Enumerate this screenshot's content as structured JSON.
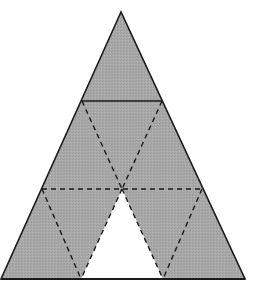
{
  "diagram": {
    "colors": {
      "background": "#ffffff",
      "shaded_fill": "#a8a8a8",
      "unshaded_fill": "#ffffff",
      "stroke": "#1a1a1a"
    },
    "outer_triangle": {
      "apex": [
        121,
        12
      ],
      "base_left": [
        1,
        279
      ],
      "base_right": [
        245,
        279
      ]
    },
    "solid_lines": [
      {
        "from": [
          82,
          101
        ],
        "to": [
          162,
          101
        ]
      }
    ],
    "dashed_lines": [
      {
        "from": [
          42,
          189
        ],
        "to": [
          202,
          189
        ]
      },
      {
        "from": [
          82,
          101
        ],
        "to": [
          122,
          189
        ]
      },
      {
        "from": [
          162,
          101
        ],
        "to": [
          122,
          189
        ]
      },
      {
        "from": [
          42,
          189
        ],
        "to": [
          81,
          279
        ]
      },
      {
        "from": [
          202,
          189
        ],
        "to": [
          163,
          279
        ]
      },
      {
        "from": [
          122,
          189
        ],
        "to": [
          81,
          279
        ]
      },
      {
        "from": [
          122,
          189
        ],
        "to": [
          163,
          279
        ]
      }
    ],
    "unshaded_triangle": {
      "top": [
        122,
        189
      ],
      "bottom_left": [
        81,
        279
      ],
      "bottom_right": [
        163,
        279
      ]
    },
    "small_triangle_count": 9,
    "shaded_count": 8,
    "unshaded_count": 1
  }
}
